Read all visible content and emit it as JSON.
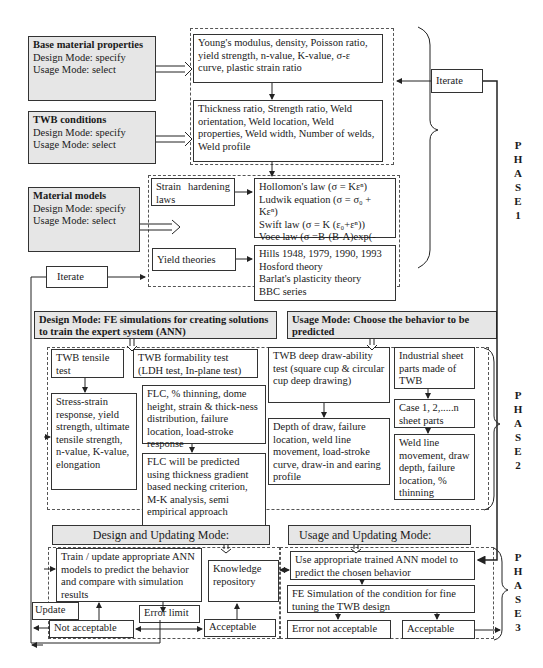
{
  "phase1": {
    "inputs": [
      {
        "title": "Base material properties",
        "design_mode": "Design Mode: specify",
        "usage_mode": "Usage Mode: select"
      },
      {
        "title": "TWB conditions",
        "design_mode": "Design Mode: specify",
        "usage_mode": "Usage Mode: select"
      },
      {
        "title": "Material models",
        "design_mode": "Design Mode:  specify",
        "usage_mode": "Usage Mode: select"
      }
    ],
    "base_properties_text": "Young's modulus, density, Poisson ratio, yield strength, n-value, K-value, σ-ε curve, plastic strain ratio",
    "twb_conditions_text": "Thickness ratio, Strength ratio, Weld orientation, Weld location, Weld properties, Weld width, Number of welds, Weld profile",
    "strain_hardening_label": "Strain hardening laws",
    "hardening_laws": [
      "Hollomon's law (σ = Kεⁿ)",
      "Ludwik equation (σ = σ₀ + Kεⁿ)",
      "Swift law (σ = K (ε₀+εⁿ))",
      "Voce law (σ =B-(B-A)exp(-n₀ε))"
    ],
    "yield_theories_label": "Yield theories",
    "yield_theories": [
      "Hills 1948, 1979, 1990, 1993",
      "Hosford theory",
      "Barlat's plasticity theory",
      "BBC series"
    ],
    "iterate_right": "Iterate",
    "iterate_left": "Iterate",
    "phase_label": [
      "P",
      "H",
      "A",
      "S",
      "E",
      "1"
    ]
  },
  "phase2": {
    "design_mode_header": "Design Mode: FE simulations for creating solutions to train the expert system (ANN)",
    "usage_mode_header": "Usage Mode: Choose the behavior to be predicted",
    "tensile_test": "TWB tensile test",
    "tensile_outputs": "Stress-strain response, yield strength, ultimate tensile strength, n-value, K-value, elongation",
    "formability_test": "TWB formability test (LDH test, In-plane test)",
    "formability_outputs": "FLC, % thinning, dome height, strain & thick-ness distribution, failure location, load-stroke response",
    "flc_prediction": "FLC will be predicted using thickness gradient based necking criterion, M-K analysis, semi empirical approach",
    "deep_draw_test": "TWB deep draw-ability test (square cup & circular cup deep drawing)",
    "deep_draw_outputs": "Depth of draw, failure location, weld line movement, load-stroke curve, draw-in and earing profile",
    "industrial_parts": "Industrial sheet parts made of TWB",
    "cases": "Case 1, 2,.....n sheet parts",
    "industrial_outputs": "Weld line movement, draw depth, failure location, % thinning",
    "phase_label": [
      "P",
      "H",
      "A",
      "S",
      "E",
      "2"
    ]
  },
  "phase3": {
    "design_updating_header": "Design and Updating Mode:",
    "usage_updating_header": "Usage and Updating Mode:",
    "train_ann": "Train / update appropriate ANN models to predict the behavior and compare with simulation results",
    "knowledge_repository": "Knowledge repository",
    "error_limit": "Error limit",
    "update": "Update",
    "not_acceptable": "Not acceptable",
    "acceptable_left": "Acceptable",
    "use_trained_ann": "Use appropriate trained ANN model to predict the chosen behavior",
    "fe_simulation": "FE Simulation of the condition for fine tuning the TWB design",
    "error_not_acceptable": "Error not acceptable",
    "acceptable_right": "Acceptable",
    "phase_label": [
      "P",
      "H",
      "A",
      "S",
      "E",
      "3"
    ]
  }
}
